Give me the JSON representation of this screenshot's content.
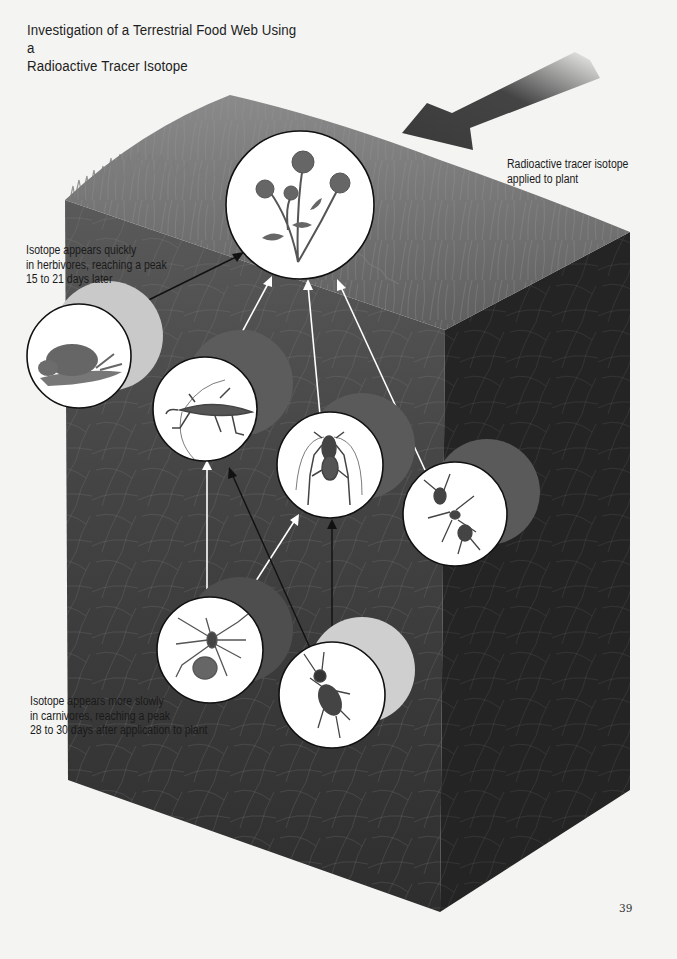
{
  "page": {
    "title_lines": [
      "Investigation of a Terrestrial Food Web Using a",
      "Radioactive Tracer Isotope"
    ],
    "page_number": "39"
  },
  "annotations": {
    "tracer": {
      "lines": [
        "Radioactive tracer isotope",
        "applied to plant"
      ]
    },
    "herbivores": {
      "lines": [
        "Isotope appears quickly",
        "in herbivores, reaching a peak",
        "15 to 21 days later"
      ]
    },
    "carnivores": {
      "lines": [
        "Isotope appears more slowly",
        "in carnivores, reaching a peak",
        "28 to 30 days after application to plant"
      ]
    }
  },
  "organisms": [
    {
      "id": "plant",
      "label": "Flowering plant",
      "trophic": "producer"
    },
    {
      "id": "snail",
      "label": "Snail",
      "trophic": "herbivore"
    },
    {
      "id": "grasshopper",
      "label": "Grasshopper",
      "trophic": "herbivore"
    },
    {
      "id": "cricket",
      "label": "Cricket",
      "trophic": "herbivore"
    },
    {
      "id": "ant",
      "label": "Ant",
      "trophic": "herbivore"
    },
    {
      "id": "spider",
      "label": "Spider",
      "trophic": "carnivore"
    },
    {
      "id": "ground-beetle",
      "label": "Ground beetle",
      "trophic": "carnivore"
    }
  ],
  "links": [
    {
      "from": "snail",
      "to": "plant",
      "color": "black"
    },
    {
      "from": "grasshopper",
      "to": "plant",
      "color": "white"
    },
    {
      "from": "cricket",
      "to": "plant",
      "color": "white"
    },
    {
      "from": "ant",
      "to": "plant",
      "color": "white"
    },
    {
      "from": "spider",
      "to": "grasshopper",
      "color": "white"
    },
    {
      "from": "spider",
      "to": "cricket",
      "color": "white"
    },
    {
      "from": "ground-beetle",
      "to": "grasshopper",
      "color": "black"
    },
    {
      "from": "ground-beetle",
      "to": "cricket",
      "color": "black"
    }
  ],
  "colors": {
    "page_bg": "#f4f4f2",
    "grass_top": "#6f6f6f",
    "front_face": "#3a3a3a",
    "side_face": "#262626",
    "herbivore_shadow_light": "#c9c9c9",
    "herbivore_shadow_dark": "#5c5c5c",
    "tracer_arrow": "#3a3a3a"
  }
}
